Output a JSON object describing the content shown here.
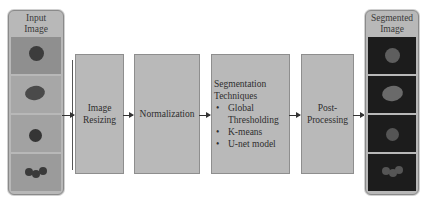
{
  "input_panel": {
    "title_line1": "Input",
    "title_line2": "Image"
  },
  "steps": [
    {
      "line1": "Image",
      "line2": "Resizing"
    },
    {
      "line1": "Normalization"
    },
    {
      "title_line1": "Segmentation",
      "title_line2": "Techniques",
      "bullets": [
        "Global Thresholding",
        "K-means",
        "U-net model"
      ]
    },
    {
      "line1": "Post-",
      "line2": "Processing"
    }
  ],
  "output_panel": {
    "title_line1": "Segmented",
    "title_line2": "Image"
  },
  "colors": {
    "box_fill": "#b9b9b9",
    "panel_fill": "#b8b8b8",
    "mask_bg": "#1c1c1c",
    "arrow": "#333333"
  }
}
